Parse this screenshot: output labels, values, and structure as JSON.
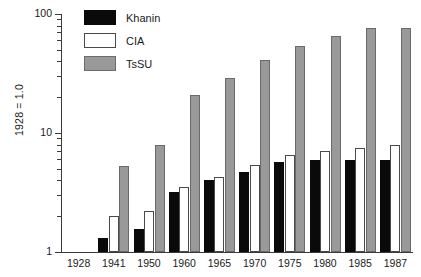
{
  "chart_data": {
    "type": "bar",
    "title": "",
    "subtitle": "",
    "xlabel": "",
    "ylabel": "1928 = 1.0",
    "yscale": "log",
    "ylim": [
      1,
      100
    ],
    "ytick_labels": [
      "100",
      "10",
      "1"
    ],
    "ytick_values": [
      100,
      10,
      1
    ],
    "grid": false,
    "legend_position": "top-left",
    "categories": [
      "1928",
      "1941",
      "1950",
      "1960",
      "1965",
      "1970",
      "1975",
      "1980",
      "1985",
      "1987"
    ],
    "series": [
      {
        "name": "Khanin",
        "color": "#0a0a0a",
        "values": [
          null,
          1.3,
          1.55,
          3.2,
          4.0,
          4.7,
          5.7,
          5.9,
          5.9,
          5.9
        ]
      },
      {
        "name": "CIA",
        "color": "#ffffff",
        "values": [
          null,
          2.0,
          2.2,
          3.5,
          4.3,
          5.4,
          6.5,
          7.0,
          7.5,
          8.0
        ]
      },
      {
        "name": "TsSU",
        "color": "#999999",
        "values": [
          null,
          5.3,
          7.9,
          21,
          29,
          41,
          54,
          65,
          76,
          77
        ]
      }
    ]
  },
  "legend": {
    "items": [
      {
        "label": "Khanin",
        "swatch": "khanin"
      },
      {
        "label": "CIA",
        "swatch": "cia"
      },
      {
        "label": "TsSU",
        "swatch": "tssu"
      }
    ]
  }
}
